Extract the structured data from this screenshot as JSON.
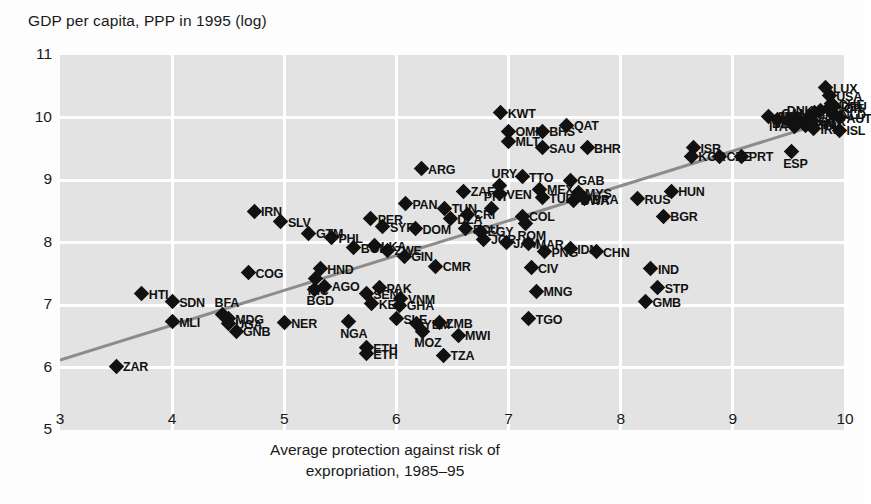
{
  "chart_data": {
    "type": "scatter",
    "title": "",
    "ylabel": "GDP per capita, PPP in 1995 (log)",
    "xlabel_line1": "Average protection against risk of",
    "xlabel_line2": "expropriation, 1985–95",
    "xlim": [
      3,
      10
    ],
    "ylim": [
      5,
      11
    ],
    "xticks": [
      3,
      4,
      5,
      6,
      7,
      8,
      9,
      10
    ],
    "yticks": [
      5,
      6,
      7,
      8,
      9,
      10,
      11
    ],
    "grid": true,
    "legend": "none",
    "marker": "diamond",
    "marker_color": "#111111",
    "plot_bg": "#e3e3e3",
    "grid_color": "#ffffff",
    "fit_line": {
      "color": "#8c8c8c",
      "x0": 3.0,
      "y0": 6.12,
      "x1": 10.0,
      "y1": 10.02
    },
    "points": [
      {
        "label": "ZAR",
        "x": 3.5,
        "y": 6.02,
        "pos": "r"
      },
      {
        "label": "HTI",
        "x": 3.73,
        "y": 7.18,
        "pos": "r"
      },
      {
        "label": "SDN",
        "x": 4.0,
        "y": 7.05,
        "pos": "r"
      },
      {
        "label": "MLI",
        "x": 4.0,
        "y": 6.73,
        "pos": "r"
      },
      {
        "label": "BFA",
        "x": 4.45,
        "y": 6.85,
        "pos": "t"
      },
      {
        "label": "MDG",
        "x": 4.5,
        "y": 6.78,
        "pos": "r"
      },
      {
        "label": "UGA",
        "x": 4.5,
        "y": 6.7,
        "pos": "r"
      },
      {
        "label": "GNB",
        "x": 4.57,
        "y": 6.58,
        "pos": "r"
      },
      {
        "label": "IRN",
        "x": 4.73,
        "y": 8.5,
        "pos": "r"
      },
      {
        "label": "COG",
        "x": 4.68,
        "y": 7.52,
        "pos": "r"
      },
      {
        "label": "SLV",
        "x": 4.97,
        "y": 8.33,
        "pos": "r"
      },
      {
        "label": "NER",
        "x": 5.0,
        "y": 6.72,
        "pos": "r"
      },
      {
        "label": "GTM",
        "x": 5.22,
        "y": 8.15,
        "pos": "r"
      },
      {
        "label": "BGD",
        "x": 5.27,
        "y": 7.25,
        "pos": "b"
      },
      {
        "label": "HND",
        "x": 5.32,
        "y": 7.58,
        "pos": "r"
      },
      {
        "label": "NIC",
        "x": 5.28,
        "y": 7.42,
        "pos": "b"
      },
      {
        "label": "AGO",
        "x": 5.36,
        "y": 7.3,
        "pos": "r"
      },
      {
        "label": "PHL",
        "x": 5.42,
        "y": 8.08,
        "pos": "r"
      },
      {
        "label": "NGA",
        "x": 5.57,
        "y": 6.73,
        "pos": "b"
      },
      {
        "label": "ETH",
        "x": 5.73,
        "y": 6.32,
        "pos": "r"
      },
      {
        "label": "ETH2",
        "x": 5.73,
        "y": 6.22,
        "pos": "r"
      },
      {
        "label": "BOL",
        "x": 5.62,
        "y": 7.92,
        "pos": "r"
      },
      {
        "label": "PER",
        "x": 5.77,
        "y": 8.38,
        "pos": "r"
      },
      {
        "label": "LKA",
        "x": 5.8,
        "y": 7.95,
        "pos": "r"
      },
      {
        "label": "ZWE",
        "x": 5.92,
        "y": 7.88,
        "pos": "r"
      },
      {
        "label": "SYR",
        "x": 5.88,
        "y": 8.25,
        "pos": "r"
      },
      {
        "label": "SEN",
        "x": 5.73,
        "y": 7.18,
        "pos": "r"
      },
      {
        "label": "KEN",
        "x": 5.78,
        "y": 7.02,
        "pos": "r"
      },
      {
        "label": "PAK",
        "x": 5.85,
        "y": 7.28,
        "pos": "r"
      },
      {
        "label": "SLE",
        "x": 6.0,
        "y": 6.78,
        "pos": "r"
      },
      {
        "label": "GHA",
        "x": 6.03,
        "y": 7.0,
        "pos": "r"
      },
      {
        "label": "VNM",
        "x": 6.04,
        "y": 7.1,
        "pos": "r"
      },
      {
        "label": "PAN",
        "x": 6.08,
        "y": 8.62,
        "pos": "r"
      },
      {
        "label": "GIN",
        "x": 6.07,
        "y": 7.78,
        "pos": "r"
      },
      {
        "label": "DOM",
        "x": 6.17,
        "y": 8.22,
        "pos": "r"
      },
      {
        "label": "YEM",
        "x": 6.18,
        "y": 6.7,
        "pos": "r"
      },
      {
        "label": "MOZ",
        "x": 6.23,
        "y": 6.58,
        "pos": "b"
      },
      {
        "label": "ARG",
        "x": 6.22,
        "y": 9.18,
        "pos": "r"
      },
      {
        "label": "TUN",
        "x": 6.43,
        "y": 8.55,
        "pos": "r"
      },
      {
        "label": "CMR",
        "x": 6.35,
        "y": 7.62,
        "pos": "r"
      },
      {
        "label": "ZMB",
        "x": 6.38,
        "y": 6.72,
        "pos": "r"
      },
      {
        "label": "TZA",
        "x": 6.42,
        "y": 6.2,
        "pos": "r"
      },
      {
        "label": "MWI",
        "x": 6.55,
        "y": 6.52,
        "pos": "r"
      },
      {
        "label": "DZA",
        "x": 6.48,
        "y": 8.38,
        "pos": "r"
      },
      {
        "label": "ZAF",
        "x": 6.6,
        "y": 8.82,
        "pos": "r"
      },
      {
        "label": "ECU",
        "x": 6.62,
        "y": 8.22,
        "pos": "r"
      },
      {
        "label": "CRI",
        "x": 6.63,
        "y": 8.45,
        "pos": "r"
      },
      {
        "label": "EGY",
        "x": 6.75,
        "y": 8.18,
        "pos": "r"
      },
      {
        "label": "JOR",
        "x": 6.78,
        "y": 8.05,
        "pos": "r"
      },
      {
        "label": "PRY",
        "x": 6.85,
        "y": 8.55,
        "pos": "t"
      },
      {
        "label": "URY",
        "x": 6.92,
        "y": 8.92,
        "pos": "t"
      },
      {
        "label": "VEN",
        "x": 6.92,
        "y": 8.78,
        "pos": "r"
      },
      {
        "label": "JAM",
        "x": 6.98,
        "y": 8.0,
        "pos": "r"
      },
      {
        "label": "KWT",
        "x": 6.93,
        "y": 10.08,
        "pos": "r"
      },
      {
        "label": "OMN",
        "x": 7.0,
        "y": 9.78,
        "pos": "r"
      },
      {
        "label": "MLT",
        "x": 7.0,
        "y": 9.62,
        "pos": "r"
      },
      {
        "label": "TTO",
        "x": 7.12,
        "y": 9.05,
        "pos": "r"
      },
      {
        "label": "COL",
        "x": 7.12,
        "y": 8.42,
        "pos": "r"
      },
      {
        "label": "ROM",
        "x": 7.15,
        "y": 8.3,
        "pos": "b"
      },
      {
        "label": "MAR",
        "x": 7.18,
        "y": 7.98,
        "pos": "r"
      },
      {
        "label": "CIV",
        "x": 7.2,
        "y": 7.6,
        "pos": "r"
      },
      {
        "label": "TGO",
        "x": 7.18,
        "y": 6.78,
        "pos": "r"
      },
      {
        "label": "BHS",
        "x": 7.3,
        "y": 9.78,
        "pos": "r"
      },
      {
        "label": "SAU",
        "x": 7.3,
        "y": 9.52,
        "pos": "r"
      },
      {
        "label": "MEX",
        "x": 7.28,
        "y": 8.85,
        "pos": "r"
      },
      {
        "label": "TUR",
        "x": 7.3,
        "y": 8.72,
        "pos": "r"
      },
      {
        "label": "PNG",
        "x": 7.32,
        "y": 7.85,
        "pos": "r"
      },
      {
        "label": "MNG",
        "x": 7.25,
        "y": 7.22,
        "pos": "r"
      },
      {
        "label": "QAT",
        "x": 7.52,
        "y": 9.88,
        "pos": "r"
      },
      {
        "label": "GAB",
        "x": 7.55,
        "y": 9.0,
        "pos": "r"
      },
      {
        "label": "MYS",
        "x": 7.62,
        "y": 8.8,
        "pos": "r"
      },
      {
        "label": "BWA",
        "x": 7.58,
        "y": 8.68,
        "pos": "r"
      },
      {
        "label": "BRA",
        "x": 7.68,
        "y": 8.7,
        "pos": "r"
      },
      {
        "label": "BHR",
        "x": 7.7,
        "y": 9.52,
        "pos": "r"
      },
      {
        "label": "IDN",
        "x": 7.55,
        "y": 7.9,
        "pos": "r"
      },
      {
        "label": "CHN",
        "x": 7.78,
        "y": 7.85,
        "pos": "r"
      },
      {
        "label": "IND",
        "x": 8.27,
        "y": 7.58,
        "pos": "r"
      },
      {
        "label": "STP",
        "x": 8.33,
        "y": 7.28,
        "pos": "r"
      },
      {
        "label": "GMB",
        "x": 8.22,
        "y": 7.05,
        "pos": "r"
      },
      {
        "label": "RUS",
        "x": 8.15,
        "y": 8.7,
        "pos": "r"
      },
      {
        "label": "BGR",
        "x": 8.38,
        "y": 8.42,
        "pos": "r"
      },
      {
        "label": "HUN",
        "x": 8.45,
        "y": 8.82,
        "pos": "r"
      },
      {
        "label": "ISR",
        "x": 8.65,
        "y": 9.52,
        "pos": "r"
      },
      {
        "label": "KOR",
        "x": 8.63,
        "y": 9.38,
        "pos": "r"
      },
      {
        "label": "CZE",
        "x": 8.88,
        "y": 9.38,
        "pos": "r"
      },
      {
        "label": "PRT",
        "x": 9.08,
        "y": 9.38,
        "pos": "r"
      },
      {
        "label": "AUS",
        "x": 9.32,
        "y": 10.02,
        "pos": "r"
      },
      {
        "label": "SGP",
        "x": 9.4,
        "y": 9.97,
        "pos": "r"
      },
      {
        "label": "NZL",
        "x": 9.5,
        "y": 9.95,
        "pos": "r"
      },
      {
        "label": "SWE",
        "x": 9.58,
        "y": 9.98,
        "pos": "r"
      },
      {
        "label": "ESP",
        "x": 9.52,
        "y": 9.45,
        "pos": "b"
      },
      {
        "label": "LUX",
        "x": 9.83,
        "y": 10.48,
        "pos": "r"
      },
      {
        "label": "USA",
        "x": 9.86,
        "y": 10.35,
        "pos": "r"
      },
      {
        "label": "CHE",
        "x": 9.88,
        "y": 10.22,
        "pos": "r"
      },
      {
        "label": "NOR",
        "x": 9.85,
        "y": 10.15,
        "pos": "r"
      },
      {
        "label": "DNK",
        "x": 9.78,
        "y": 10.12,
        "pos": "l"
      },
      {
        "label": "NLD",
        "x": 9.9,
        "y": 10.05,
        "pos": "r"
      },
      {
        "label": "CAN",
        "x": 9.73,
        "y": 10.08,
        "pos": "l"
      },
      {
        "label": "JPN",
        "x": 9.68,
        "y": 10.02,
        "pos": "l"
      },
      {
        "label": "GBR",
        "x": 9.7,
        "y": 9.95,
        "pos": "r"
      },
      {
        "label": "AUT",
        "x": 9.95,
        "y": 10.0,
        "pos": "r"
      },
      {
        "label": "BEL",
        "x": 9.63,
        "y": 9.92,
        "pos": "l"
      },
      {
        "label": "FRA",
        "x": 9.65,
        "y": 9.88,
        "pos": "r"
      },
      {
        "label": "DEU",
        "x": 9.9,
        "y": 10.18,
        "pos": "r"
      },
      {
        "label": "FIN",
        "x": 9.67,
        "y": 9.9,
        "pos": "r"
      },
      {
        "label": "ITA",
        "x": 9.55,
        "y": 9.86,
        "pos": "l"
      },
      {
        "label": "IRL",
        "x": 9.72,
        "y": 9.82,
        "pos": "r"
      },
      {
        "label": "ISL",
        "x": 9.95,
        "y": 9.8,
        "pos": "r"
      }
    ]
  }
}
